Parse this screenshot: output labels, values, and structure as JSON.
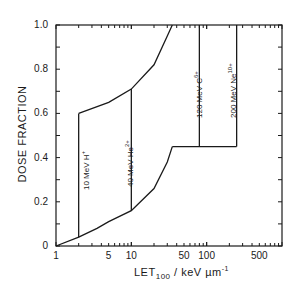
{
  "chart_data": {
    "type": "area",
    "title": "",
    "xlabel": "LET100 / keV µm^-1",
    "xlabel_main": "LET",
    "xlabel_sub": "100",
    "xlabel_rest": " / keV µm",
    "xlabel_sup": "-1",
    "ylabel": "DOSE FRACTION",
    "xscale": "log",
    "xlim": [
      1,
      1000
    ],
    "ylim": [
      0,
      1.0
    ],
    "x_tick_labels": [
      "1",
      "5",
      "10",
      "50",
      "100",
      "500"
    ],
    "y_tick_labels": [
      "0",
      "0.2",
      "0.4",
      "0.6",
      "0.8",
      "1.0"
    ],
    "grid": false,
    "series": [
      {
        "name": "lower boundary curve",
        "x": [
          1,
          2,
          3.5,
          5,
          10,
          20,
          30,
          35
        ],
        "y": [
          0,
          0.04,
          0.08,
          0.11,
          0.16,
          0.26,
          0.38,
          0.45
        ]
      },
      {
        "name": "upper boundary curve",
        "x": [
          2,
          5,
          10,
          20,
          30,
          35
        ],
        "y": [
          0.6,
          0.65,
          0.71,
          0.82,
          0.95,
          1.0
        ]
      },
      {
        "name": "step plateau",
        "x": [
          35,
          250
        ],
        "y": [
          0.45,
          0.45
        ]
      }
    ],
    "regions": [
      {
        "label": "10 MeV H+",
        "ion": "H",
        "charge": "+",
        "energy": "10 MeV",
        "x_boundary": 2.0,
        "y_range": [
          0.04,
          0.6
        ]
      },
      {
        "label": "40 MeV He2+",
        "ion": "He",
        "charge": "2+",
        "energy": "40 MeV",
        "x_boundary": 10.0,
        "y_range": [
          0.16,
          0.71
        ]
      },
      {
        "label": "120 MeV C6+",
        "ion": "C",
        "charge": "6+",
        "energy": "120 MeV",
        "x_boundary": 80,
        "y_range": [
          0.45,
          1.0
        ]
      },
      {
        "label": "200 MeV Ne10+",
        "ion": "Ne",
        "charge": "10+",
        "energy": "200 MeV",
        "x_boundary": 250,
        "y_range": [
          0.45,
          1.0
        ]
      }
    ]
  },
  "labels": {
    "ions": [
      {
        "name": "10 MeV H",
        "charge": "+"
      },
      {
        "name": "40 MeV He",
        "charge": "2+"
      },
      {
        "name": "120 MeV C",
        "charge": "6+"
      },
      {
        "name": "200 MeV Ne",
        "charge": "10+"
      }
    ]
  }
}
